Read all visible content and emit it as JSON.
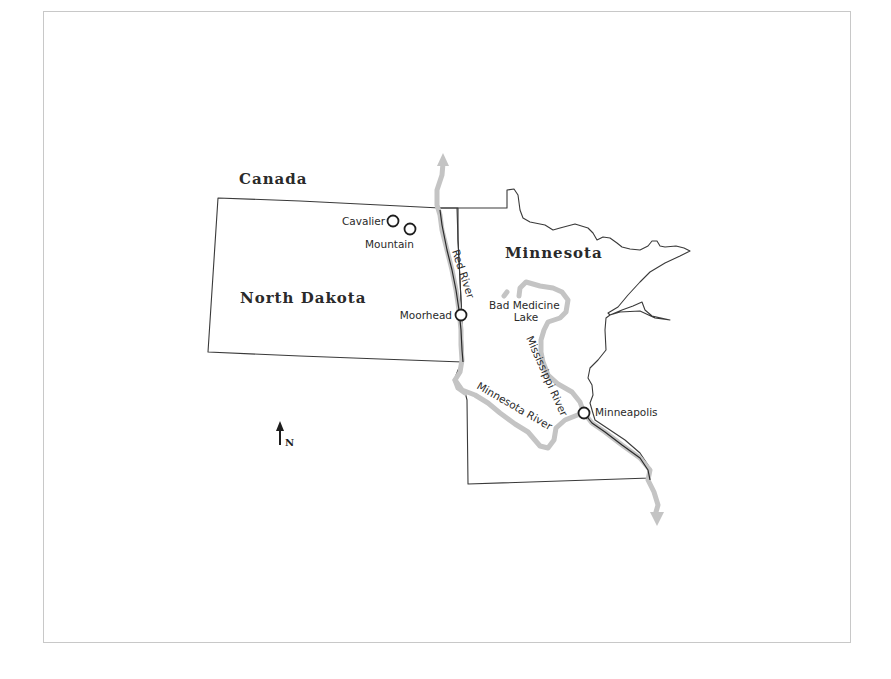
{
  "map": {
    "regions": [
      {
        "id": "canada",
        "label": "Canada"
      },
      {
        "id": "north-dakota",
        "label": "North Dakota"
      },
      {
        "id": "minnesota",
        "label": "Minnesota"
      }
    ],
    "cities": [
      {
        "id": "cavalier",
        "label": "Cavalier"
      },
      {
        "id": "mountain",
        "label": "Mountain"
      },
      {
        "id": "moorhead",
        "label": "Moorhead"
      },
      {
        "id": "minneapolis",
        "label": "Minneapolis"
      }
    ],
    "rivers": [
      {
        "id": "red-river",
        "label": "Red River"
      },
      {
        "id": "mississippi-river",
        "label": "Mississippi River"
      },
      {
        "id": "minnesota-river",
        "label": "Minnesota River"
      }
    ],
    "lakes": [
      {
        "id": "bad-medicine-lake",
        "label_line1": "Bad Medicine",
        "label_line2": "Lake"
      }
    ],
    "compass": {
      "label": "N"
    },
    "colors": {
      "border": "#3a3a3a",
      "river_highlight": "#c4c4c4",
      "marker": "#1e1e1e",
      "frame": "#c8c8c8"
    }
  }
}
